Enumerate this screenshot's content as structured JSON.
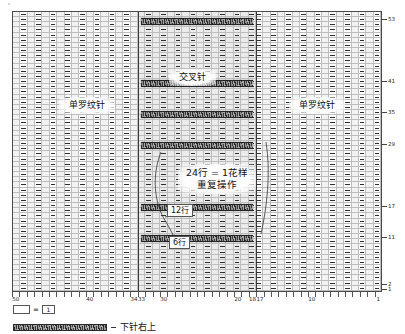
{
  "chart_data": {
    "type": "table",
    "title": "",
    "xlabel": "",
    "ylabel": "",
    "grid": {
      "columns": 50,
      "rows": 54
    },
    "x_axis": {
      "direction": "right-to-left",
      "tick_labels": [
        "50",
        "40",
        "34",
        "33",
        "30",
        "20",
        "18",
        "17",
        "10",
        "1"
      ],
      "tick_positions": [
        50,
        40,
        34,
        33,
        30,
        20,
        18,
        17,
        10,
        1
      ]
    },
    "y_axis": {
      "direction": "bottom-to-top",
      "tick_labels": [
        "53",
        "41",
        "35",
        "29",
        "17",
        "11",
        "2",
        "1"
      ],
      "tick_positions": [
        53,
        41,
        35,
        29,
        17,
        11,
        2,
        1
      ]
    },
    "sections": [
      {
        "name": "单罗纹针",
        "from_stitch": 50,
        "to_stitch": 34
      },
      {
        "name": "交叉针",
        "from_stitch": 33,
        "to_stitch": 18
      },
      {
        "name": "单罗纹针",
        "from_stitch": 17,
        "to_stitch": 1
      }
    ],
    "cable_rows": [
      53,
      41,
      35,
      29,
      17,
      11
    ],
    "repeat_rows": 24,
    "repeat_unit": "1花样"
  },
  "chart": {
    "labels": {
      "left_rib": "单罗纹针",
      "center_cable": "交叉针",
      "right_rib": "单罗纹针",
      "repeat_line1": "24行 = 1花样",
      "repeat_line2": "重复操作",
      "rows_12": "12行",
      "rows_6": "6行"
    },
    "x_tick_labels": [
      "50",
      "40",
      "34",
      "33",
      "30",
      "20",
      "18",
      "17",
      "10",
      "1"
    ],
    "y_tick_labels": [
      "53",
      "41",
      "35",
      "29",
      "17",
      "11",
      "2",
      "1"
    ]
  },
  "legend": {
    "blank_symbol": "",
    "equals": "=",
    "one_symbol": "1",
    "cable_label": "下针右上"
  }
}
